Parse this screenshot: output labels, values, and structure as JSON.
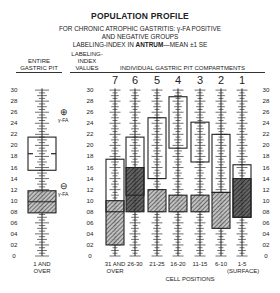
{
  "chart_data": {
    "type": "box-range",
    "title": "POPULATION PROFILE",
    "subtitle_lines": [
      "FOR CHRONIC ATROPHIC GASTRITIS: γ-FA POSITIVE",
      "AND NEGATIVE GROUPS",
      "LABELING-INDEX IN ANTRUM—MEAN ±1 SE"
    ],
    "ylabel": "LABELING-INDEX VALUES",
    "xlabel": "CELL POSITIONS",
    "ylim": [
      0,
      30
    ],
    "yticks": [
      "30",
      "28",
      "26",
      "24",
      "22",
      "20",
      "18",
      "16",
      "14",
      "12",
      "10",
      "08",
      "06",
      "04",
      "02",
      "0"
    ],
    "entire_pit": {
      "header": "ENTIRE GASTRIC PIT",
      "category": "1 AND OVER",
      "positive": {
        "label": "⊕ γ-FA",
        "low": 15.5,
        "mean": 18.5,
        "high": 21.5
      },
      "negative": {
        "label": "⊖ γ-FA",
        "low": 7.8,
        "mean": 9.8,
        "high": 11.8
      }
    },
    "compartments_header": "INDIVIDUAL GASTRIC PIT COMPARTMENTS",
    "categories": [
      "31 AND OVER",
      "26-30",
      "21-25",
      "16-20",
      "11-15",
      "6-10",
      "1-5 (SURFACE)"
    ],
    "compartment_numbers": [
      "7",
      "6",
      "5",
      "4",
      "3",
      "2",
      "1"
    ],
    "series": [
      {
        "name": "γ-FA positive",
        "low": [
          8.0,
          11.0,
          14.0,
          19.5,
          17.0,
          11.5,
          7.0
        ],
        "high": [
          17.5,
          21.5,
          25.0,
          28.8,
          24.2,
          22.0,
          16.5
        ]
      },
      {
        "name": "γ-FA negative",
        "low": [
          2.0,
          8.0,
          8.0,
          8.0,
          8.0,
          5.0,
          7.0
        ],
        "high": [
          10.0,
          16.0,
          12.0,
          11.0,
          11.0,
          11.5,
          14.0
        ]
      }
    ],
    "annotations": [
      "*",
      "*",
      "* *",
      "* *"
    ]
  },
  "labels": {
    "title": "POPULATION PROFILE",
    "sub1": "FOR CHRONIC ATROPHIC GASTRITIS: γ-FA POSITIVE",
    "sub2": "AND NEGATIVE GROUPS",
    "sub3_a": "LABELING-INDEX IN ",
    "sub3_b": "ANTRUM",
    "sub3_c": "—MEAN ±1 SE",
    "entire1": "ENTIRE",
    "entire2": "GASTRIC PIT",
    "li1": "LABELING-",
    "li2": "INDEX",
    "li3": "VALUES",
    "comp": "INDIVIDUAL GASTRIC PIT COMPARTMENTS",
    "pos": "⊕",
    "neg": "⊖",
    "gfa": "γ-FA",
    "entire_x": "1 AND OVER",
    "cellpos": "CELL POSITIONS",
    "x7a": "31 AND",
    "x7b": "OVER",
    "x6": "26-30",
    "x5": "21-25",
    "x4": "16-20",
    "x3": "11-15",
    "x2": "6-10",
    "x1a": "1-5",
    "x1b": "(SURFACE)",
    "n7": "7",
    "n6": "6",
    "n5": "5",
    "n4": "4",
    "n3": "3",
    "n2": "2",
    "n1": "1"
  }
}
